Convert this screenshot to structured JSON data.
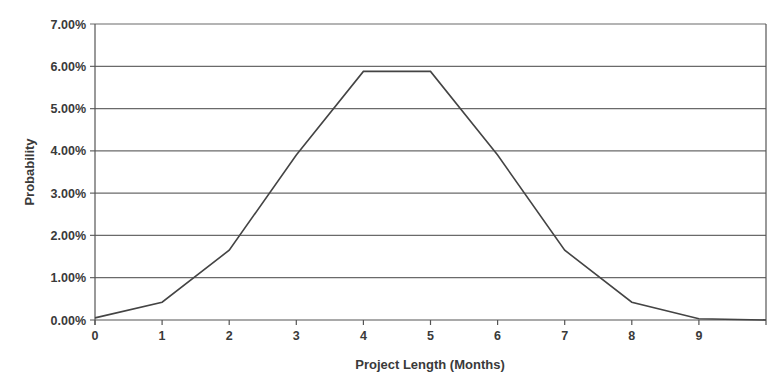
{
  "chart_data": {
    "type": "line",
    "title": "",
    "xlabel": "Project Length (Months)",
    "ylabel": "Probability",
    "x": [
      0,
      1,
      2,
      3,
      4,
      5,
      6,
      7,
      8,
      9,
      10
    ],
    "series": [
      {
        "name": "Probability",
        "values": [
          0.0005,
          0.0042,
          0.0165,
          0.039,
          0.0588,
          0.0588,
          0.039,
          0.0165,
          0.0042,
          0.0003,
          0.0
        ]
      }
    ],
    "x_tick_labels": [
      "0",
      "1",
      "2",
      "3",
      "4",
      "5",
      "6",
      "7",
      "8",
      "9"
    ],
    "y_tick_labels": [
      "0.00%",
      "1.00%",
      "2.00%",
      "3.00%",
      "4.00%",
      "5.00%",
      "6.00%",
      "7.00%"
    ],
    "xlim": [
      0,
      10
    ],
    "ylim": [
      0,
      0.07
    ],
    "grid": "horizontal",
    "legend": "none",
    "line_color": "#444444",
    "grid_color": "#6a6a6a"
  }
}
